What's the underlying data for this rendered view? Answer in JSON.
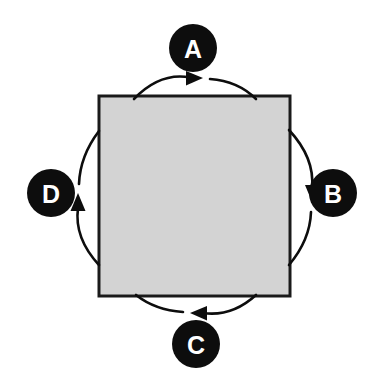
{
  "diagram": {
    "title": "",
    "type": "cycle-diagram",
    "background_color": "#ffffff",
    "direction": "clockwise",
    "center_shape": {
      "name": "process-square",
      "label": "",
      "fill_color": "#d9d9d9",
      "border_color": "#1a1a1a",
      "x": 99,
      "y": 96,
      "width": 191,
      "height": 200
    },
    "nodes": [
      {
        "id": "A",
        "label": "A",
        "position": "top",
        "cx": 193,
        "cy": 48,
        "r": 24,
        "fill_color": "#0d0d0d",
        "text_color": "#ffffff"
      },
      {
        "id": "B",
        "label": "B",
        "position": "right",
        "cx": 333,
        "cy": 193,
        "r": 24,
        "fill_color": "#0d0d0d",
        "text_color": "#ffffff"
      },
      {
        "id": "C",
        "label": "C",
        "position": "bottom",
        "cx": 196,
        "cy": 344,
        "r": 24,
        "fill_color": "#0d0d0d",
        "text_color": "#ffffff"
      },
      {
        "id": "D",
        "label": "D",
        "position": "left",
        "cx": 51,
        "cy": 193,
        "r": 24,
        "fill_color": "#0d0d0d",
        "text_color": "#ffffff"
      }
    ],
    "arrows": [
      {
        "name": "arrow-top",
        "side": "top",
        "direction": "right",
        "color": "#0d0d0d",
        "associated_node": "A"
      },
      {
        "name": "arrow-right",
        "side": "right",
        "direction": "down",
        "color": "#0d0d0d",
        "associated_node": "B"
      },
      {
        "name": "arrow-bottom",
        "side": "bottom",
        "direction": "left",
        "color": "#0d0d0d",
        "associated_node": "C"
      },
      {
        "name": "arrow-left",
        "side": "left",
        "direction": "up",
        "color": "#0d0d0d",
        "associated_node": "D"
      }
    ]
  }
}
